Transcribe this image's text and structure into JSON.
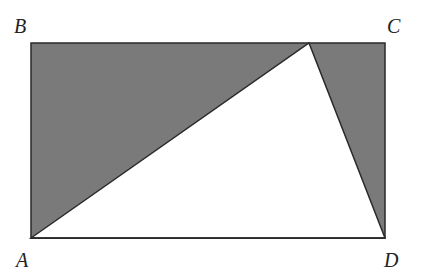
{
  "diagram": {
    "vertices": {
      "A": {
        "label": "A"
      },
      "B": {
        "label": "B"
      },
      "C": {
        "label": "C"
      },
      "D": {
        "label": "D"
      }
    },
    "shaded_regions": [
      "triangle A-B-E",
      "triangle E-C-D"
    ],
    "unshaded_region": "triangle A-E-D",
    "colors": {
      "shade": "#7a7a7a",
      "line": "#2a2a2a",
      "background": "#ffffff"
    }
  }
}
